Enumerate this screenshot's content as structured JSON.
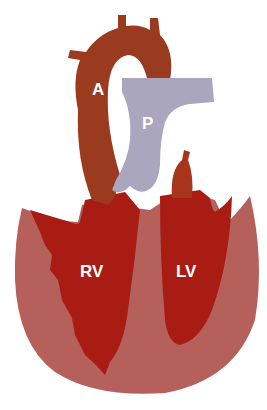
{
  "figure": {
    "type": "heart-anatomy-diagram",
    "labels": {
      "aorta": "A",
      "pulmonary_artery": "P",
      "right_ventricle": "RV",
      "left_ventricle": "LV"
    },
    "caption_cropped": true,
    "colors": {
      "myocardium": "#b5605a",
      "chamber": "#a81c14",
      "aorta": "#9a3a1e",
      "pulmonary": "#a9a6bd",
      "label_text": "#ffffff"
    }
  }
}
